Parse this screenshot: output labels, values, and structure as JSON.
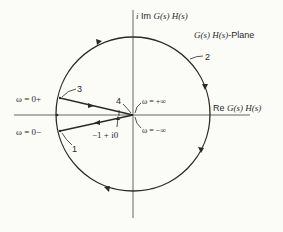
{
  "diagram": {
    "title": "G(s) H(s)-Plane",
    "plane_label_italic": "G(s) H(s)",
    "plane_label_suffix": "-Plane",
    "axes": {
      "imag_prefix": "i Im ",
      "imag_func": "G(s) H(s)",
      "real_prefix": "Re ",
      "real_func": "G(s) H(s)"
    },
    "points": {
      "omega_0_plus": "ω = 0+",
      "omega_0_minus": "ω = 0−",
      "omega_plus_inf": "ω = +∞",
      "omega_minus_inf": "ω = −∞",
      "critical_point": "−1 + i0"
    },
    "path_labels": {
      "one": "1",
      "two": "2",
      "three": "3",
      "four": "4"
    },
    "colors": {
      "stroke": "#2a2a2a",
      "axis": "#555555",
      "background": "#fbfbf8"
    }
  }
}
